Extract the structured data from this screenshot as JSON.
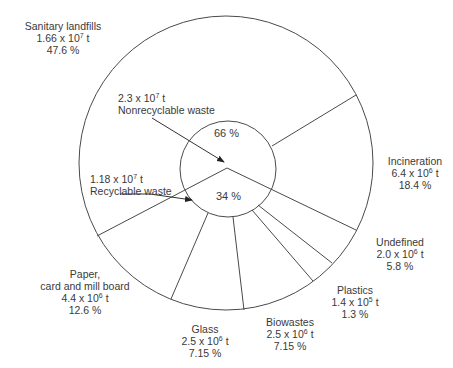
{
  "diagram": {
    "type": "two-level pie / waste flow diagram",
    "inner": {
      "nonrecyclable": {
        "amount_mantissa": "2.3 x 10",
        "exponent": "7",
        "unit": " t",
        "label": "Nonrecyclable waste",
        "percent": "66 %"
      },
      "recyclable": {
        "amount_mantissa": "1.18 x 10",
        "exponent": "7",
        "unit": " t",
        "label": "Recyclable waste",
        "percent": "34 %"
      }
    },
    "outer": [
      {
        "name": "Sanitary landfills",
        "mantissa": "1.66 x 10",
        "exponent": "7",
        "unit": " t",
        "percent": "47.6 %"
      },
      {
        "name": "Incineration",
        "mantissa": "6.4 x 10",
        "exponent": "6",
        "unit": " t",
        "percent": "18.4 %"
      },
      {
        "name": "Undefined",
        "mantissa": "2.0 x 10",
        "exponent": "6",
        "unit": " t",
        "percent": "5.8 %"
      },
      {
        "name": "Plastics",
        "mantissa": "1.4 x 10",
        "exponent": "5",
        "unit": " t",
        "percent": "1.3 %"
      },
      {
        "name": "Biowastes",
        "mantissa": "2.5 x 10",
        "exponent": "6",
        "unit": " t",
        "percent": "7.15 %"
      },
      {
        "name": "Glass",
        "mantissa": "2.5 x 10",
        "exponent": "6",
        "unit": " t",
        "percent": "7.15 %"
      },
      {
        "name_line1": "Paper,",
        "name_line2": "card and mill board",
        "mantissa": "4.4 x 10",
        "exponent": "6",
        "unit": " t",
        "percent": "12.6 %"
      }
    ],
    "colors": {
      "line": "#4a4a4a",
      "text": "#3a3a3a",
      "background": "#ffffff"
    }
  }
}
